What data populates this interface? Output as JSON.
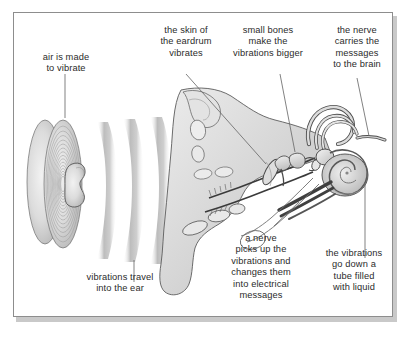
{
  "diagram": {
    "frame_color": "#8d8d8d",
    "background_color": "#ffffff",
    "text_color": "#2b2b2b",
    "artwork_fill": "#d8d8d8",
    "artwork_line": "#555555"
  },
  "labels": {
    "air": "air is made\nto vibrate",
    "eardrum": "the skin of\nthe eardrum\nvibrates",
    "bones": "small bones\nmake the\nvibrations bigger",
    "nerve_brain": "the nerve\ncarries the\nmessages\nto the brain",
    "travel": "vibrations travel\ninto the ear",
    "nerve_picks": "a nerve\npicks up the\nvibrations and\nchanges them\ninto electrical\nmessages",
    "tube": "the vibrations\ngo down a\ntube filled\nwith liquid"
  },
  "parts": {
    "speaker": "loudspeaker-cone",
    "sound_waves": "sound-wave-arcs",
    "pinna": "outer-ear-pinna",
    "ear_canal": "ear-canal",
    "eardrum": "eardrum-membrane",
    "ossicles": "small-bones-ossicles",
    "semicircular_canals": "semicircular-canals",
    "cochlea": "cochlea-spiral",
    "auditory_nerve": "auditory-nerve",
    "eustachian_tube": "eustachian-tube"
  }
}
